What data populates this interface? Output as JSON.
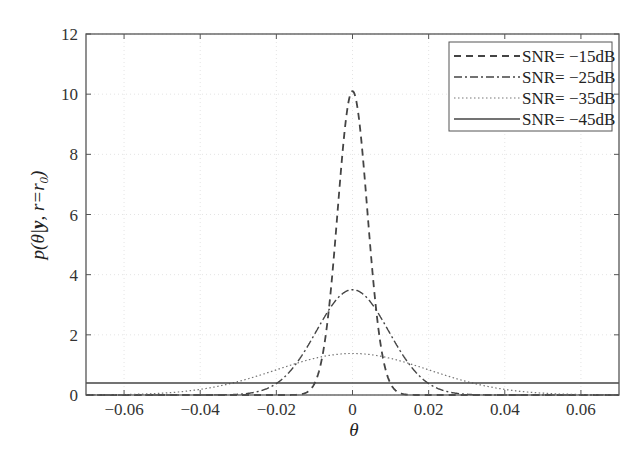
{
  "chart_data": {
    "type": "line",
    "title": "",
    "xlabel": "θ",
    "ylabel": "p(θ|y, r=r0)",
    "xlim": [
      -0.07,
      0.07
    ],
    "ylim": [
      0,
      12
    ],
    "xticks": [
      -0.06,
      -0.04,
      -0.02,
      0,
      0.02,
      0.04,
      0.06
    ],
    "xtick_labels": [
      "−0.06",
      "−0.04",
      "−0.02",
      "0",
      "0.02",
      "0.04",
      "0.06"
    ],
    "yticks": [
      0,
      2,
      4,
      6,
      8,
      10,
      12
    ],
    "ytick_labels": [
      "0",
      "2",
      "4",
      "6",
      "8",
      "10",
      "12"
    ],
    "grid": true,
    "legend_position": "upper right",
    "series": [
      {
        "name": "SNR= −15dB",
        "style": "dashed",
        "shape": "gaussian",
        "peak": 10.1,
        "center": 0,
        "sigma": 0.0039
      },
      {
        "name": "SNR= −25dB",
        "style": "dashdot",
        "shape": "gaussian",
        "peak": 3.5,
        "center": 0,
        "sigma": 0.0095
      },
      {
        "name": "SNR= −35dB",
        "style": "dotted",
        "shape": "gaussian",
        "peak": 1.38,
        "center": 0,
        "sigma": 0.02
      },
      {
        "name": "SNR= −45dB",
        "style": "solid",
        "shape": "flat",
        "peak": 0.4,
        "center": 0,
        "sigma": 0
      }
    ],
    "sample_points": {
      "x": [
        -0.06,
        -0.04,
        -0.02,
        -0.01,
        0,
        0.01,
        0.02,
        0.04,
        0.06
      ],
      "SNR= −15dB": [
        0,
        0,
        0,
        0.38,
        10.1,
        0.38,
        0,
        0,
        0
      ],
      "SNR= −25dB": [
        0,
        0,
        0.38,
        2.0,
        3.5,
        2.0,
        0.38,
        0,
        0
      ],
      "SNR= −35dB": [
        0.15,
        0.5,
        1.05,
        1.22,
        1.38,
        1.22,
        1.05,
        0.5,
        0.15
      ],
      "SNR= −45dB": [
        0.4,
        0.4,
        0.4,
        0.4,
        0.4,
        0.4,
        0.4,
        0.4,
        0.4
      ]
    }
  },
  "labels": {
    "ylabel_prefix": "p",
    "ylabel_mid": "(θ|",
    "ylabel_y": "y",
    "ylabel_rest": ", r=r",
    "ylabel_sub": "0",
    "ylabel_close": ")",
    "xlabel": "θ"
  }
}
